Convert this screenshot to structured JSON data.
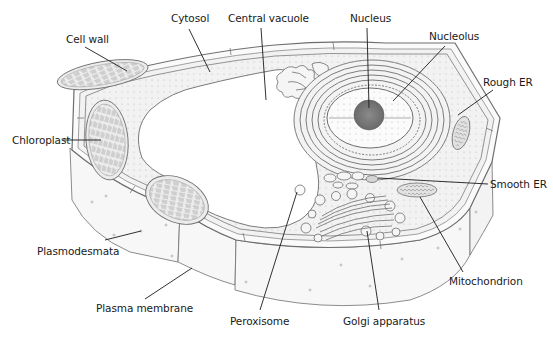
{
  "diagram": {
    "colors": {
      "outline": "#6e6e6e",
      "fill_light": "#f4f4f4",
      "fill_mid": "#e6e6e6",
      "nucleolus": "#7a7a7a",
      "leader": "#1a1a1a",
      "text": "#1a1a1a"
    },
    "labels": [
      {
        "id": "cell-wall",
        "text": "Cell wall",
        "x": 66,
        "y": 33,
        "line": [
          [
            85,
            47
          ],
          [
            127,
            71
          ]
        ]
      },
      {
        "id": "cytosol",
        "text": "Cytosol",
        "x": 171,
        "y": 12,
        "line": [
          [
            189,
            29
          ],
          [
            210,
            72
          ]
        ]
      },
      {
        "id": "central-vacuole",
        "text": "Central vacuole",
        "x": 228,
        "y": 12,
        "line": [
          [
            261,
            28
          ],
          [
            266,
            100
          ]
        ]
      },
      {
        "id": "nucleus",
        "text": "Nucleus",
        "x": 350,
        "y": 12,
        "line": [
          [
            367,
            28
          ],
          [
            369,
            108
          ]
        ]
      },
      {
        "id": "nucleolus",
        "text": "Nucleolus",
        "x": 429,
        "y": 30,
        "line": [
          [
            445,
            46
          ],
          [
            393,
            101
          ]
        ]
      },
      {
        "id": "rough-er",
        "text": "Rough ER",
        "x": 483,
        "y": 76,
        "line": [
          [
            493,
            90
          ],
          [
            458,
            115
          ]
        ]
      },
      {
        "id": "chloroplast",
        "text": "Chloroplast",
        "x": 12,
        "y": 134,
        "line": [
          [
            63,
            140
          ],
          [
            101,
            140
          ]
        ]
      },
      {
        "id": "smooth-er",
        "text": "Smooth ER",
        "x": 490,
        "y": 178,
        "line": [
          [
            488,
            184
          ],
          [
            378,
            178
          ]
        ]
      },
      {
        "id": "plasmodesmata",
        "text": "Plasmodesmata",
        "x": 37,
        "y": 245,
        "line": [
          [
            105,
            240
          ],
          [
            141,
            231
          ]
        ]
      },
      {
        "id": "mitochondrion",
        "text": "Mitochondrion",
        "x": 449,
        "y": 275,
        "line": [
          [
            463,
            272
          ],
          [
            420,
            197
          ]
        ]
      },
      {
        "id": "plasma-membrane",
        "text": "Plasma membrane",
        "x": 96,
        "y": 302,
        "line": [
          [
            145,
            299
          ],
          [
            192,
            268
          ]
        ]
      },
      {
        "id": "peroxisome",
        "text": "Peroxisome",
        "x": 230,
        "y": 315,
        "line": [
          [
            260,
            310
          ],
          [
            297,
            192
          ]
        ]
      },
      {
        "id": "golgi-apparatus",
        "text": "Golgi apparatus",
        "x": 343,
        "y": 315,
        "line": [
          [
            379,
            310
          ],
          [
            367,
            231
          ]
        ]
      }
    ]
  }
}
